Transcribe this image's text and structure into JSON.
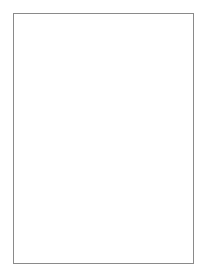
{
  "figure": {
    "panel_letter": "B",
    "labels": {
      "sodium": {
        "base": "Na",
        "charge": "+"
      },
      "chloride": {
        "base": "Cl",
        "charge": "−"
      },
      "potassium": {
        "base": "K",
        "charge": "+"
      }
    },
    "colors": {
      "frame": "#8a8a8a",
      "cation_fill": "#9e9e9e",
      "anion_fill": "#d2d2d2",
      "channel": "#8c8c8c",
      "lipid_head": "#bdbdbd",
      "arrow": "#222222"
    },
    "ions_above": [
      {
        "type": "cation",
        "x": 46,
        "y": 26,
        "r": 4
      },
      {
        "type": "anion",
        "x": 69,
        "y": 36,
        "r": 5.5
      },
      {
        "type": "anion",
        "x": 62,
        "y": 53,
        "r": 5.5
      },
      {
        "type": "cation",
        "x": 71,
        "y": 60,
        "r": 4
      },
      {
        "type": "anion",
        "x": 55,
        "y": 70,
        "r": 5.5
      },
      {
        "type": "cation",
        "x": 29,
        "y": 78,
        "r": 4
      },
      {
        "type": "anion",
        "x": 23,
        "y": 96,
        "r": 5.5
      },
      {
        "type": "anion",
        "x": 53,
        "y": 90,
        "r": 5.5
      },
      {
        "type": "cation",
        "x": 73,
        "y": 93,
        "r": 4
      },
      {
        "type": "cation",
        "x": 119,
        "y": 33,
        "r": 4
      },
      {
        "type": "cation",
        "x": 147,
        "y": 39,
        "r": 4
      },
      {
        "type": "anion",
        "x": 140,
        "y": 56,
        "r": 5.5
      },
      {
        "type": "anion",
        "x": 172,
        "y": 56,
        "r": 5.5
      },
      {
        "type": "anion",
        "x": 104,
        "y": 69,
        "r": 5.5
      },
      {
        "type": "cation",
        "x": 128,
        "y": 71,
        "r": 4
      },
      {
        "type": "anion",
        "x": 145,
        "y": 78,
        "r": 5.5
      },
      {
        "type": "cation",
        "x": 170,
        "y": 78,
        "r": 4
      },
      {
        "type": "anion",
        "x": 120,
        "y": 87,
        "r": 5.5
      },
      {
        "type": "cation",
        "x": 98,
        "y": 101,
        "r": 5.5
      },
      {
        "type": "cation",
        "x": 136,
        "y": 100,
        "r": 5.5
      }
    ],
    "ions_below": [
      {
        "type": "cation",
        "x": 30,
        "y": 174,
        "r": 5.5
      },
      {
        "type": "cation",
        "x": 58,
        "y": 176,
        "r": 5.5
      },
      {
        "type": "cation",
        "x": 90,
        "y": 172,
        "r": 5.5
      },
      {
        "type": "anion",
        "x": 112,
        "y": 174,
        "r": 5.5
      },
      {
        "type": "cation",
        "x": 152,
        "y": 173,
        "r": 5.5
      },
      {
        "type": "anion",
        "x": 43,
        "y": 183,
        "r": 5.5
      },
      {
        "type": "cation",
        "x": 129,
        "y": 180,
        "r": 5.5
      },
      {
        "type": "cation",
        "x": 167,
        "y": 182,
        "r": 5.5
      },
      {
        "type": "anion",
        "x": 75,
        "y": 188,
        "r": 5.5
      },
      {
        "type": "anion",
        "x": 97,
        "y": 189,
        "r": 5.5
      },
      {
        "type": "anion",
        "x": 23,
        "y": 193,
        "r": 5.5
      },
      {
        "type": "cation",
        "x": 41,
        "y": 199,
        "r": 5.5
      },
      {
        "type": "cation",
        "x": 115,
        "y": 195,
        "r": 5.5
      },
      {
        "type": "cation",
        "x": 147,
        "y": 194,
        "r": 5.5
      },
      {
        "type": "anion",
        "x": 88,
        "y": 202,
        "r": 5.5
      },
      {
        "type": "anion",
        "x": 132,
        "y": 203,
        "r": 5.5
      },
      {
        "type": "cation",
        "x": 67,
        "y": 206,
        "r": 5.5
      },
      {
        "type": "anion",
        "x": 22,
        "y": 211,
        "r": 5.5
      },
      {
        "type": "anion",
        "x": 107,
        "y": 217,
        "r": 5.5
      },
      {
        "type": "cation",
        "x": 127,
        "y": 220,
        "r": 5.5
      },
      {
        "type": "anion",
        "x": 169,
        "y": 213,
        "r": 5.5
      },
      {
        "type": "cation",
        "x": 46,
        "y": 224,
        "r": 5.5
      },
      {
        "type": "anion",
        "x": 85,
        "y": 226,
        "r": 5.5
      },
      {
        "type": "anion",
        "x": 114,
        "y": 233,
        "r": 5.5
      }
    ],
    "membrane": {
      "top": 113,
      "bottom": 160,
      "lipids_x": [
        19,
        27,
        35,
        43,
        69,
        77,
        107,
        115,
        145,
        153,
        161,
        169,
        177,
        185
      ],
      "channels": [
        {
          "x": 51,
          "width": 16,
          "arrow": "up"
        },
        {
          "x": 125,
          "width": 15,
          "arrow": "up-down"
        }
      ],
      "gap_arrows": [
        {
          "x": 89,
          "direction": "up"
        },
        {
          "x": 98,
          "direction": "down"
        }
      ]
    }
  }
}
